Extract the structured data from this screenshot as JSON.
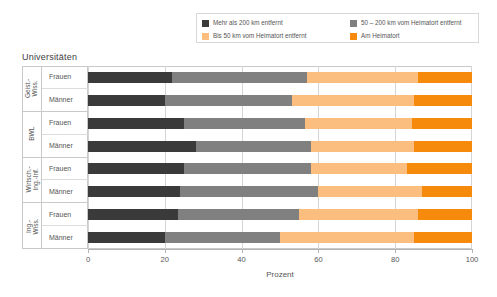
{
  "chart_data": {
    "type": "bar",
    "orientation": "horizontal",
    "stacked": true,
    "stacked_mode": "percent",
    "title": "Universitäten",
    "xlabel": "Prozent",
    "ylabel": "",
    "xlim": [
      0,
      100
    ],
    "xticks": [
      "0",
      "20",
      "40",
      "60",
      "80",
      "100"
    ],
    "grid": true,
    "legend_position": "top",
    "legend": [
      {
        "label": "Mehr als 200 km entfernt",
        "color": "#3a3a3a"
      },
      {
        "label": "50 – 200 km vom Heimatort entfernt",
        "color": "#808080"
      },
      {
        "label": "Bis 50 km vom Heimatort entfernt",
        "color": "#fbbe7e"
      },
      {
        "label": "Am Heimatort",
        "color": "#f68a0c"
      }
    ],
    "groups": [
      {
        "label": "Geist.-\nWiss.",
        "rows": [
          {
            "label": "Frauen",
            "values": [
              22,
              35,
              29,
              14
            ]
          },
          {
            "label": "Männer",
            "values": [
              20,
              33,
              32,
              15
            ]
          }
        ]
      },
      {
        "label": "BWL",
        "rows": [
          {
            "label": "Frauen",
            "values": [
              25,
              31.5,
              28,
              15.5
            ]
          },
          {
            "label": "Männer",
            "values": [
              28,
              30,
              27,
              15
            ]
          }
        ]
      },
      {
        "label": "Wirtsch.-\nIng.-Inf.",
        "rows": [
          {
            "label": "Frauen",
            "values": [
              25,
              33,
              25,
              17
            ]
          },
          {
            "label": "Männer",
            "values": [
              24,
              36,
              27,
              13
            ]
          }
        ]
      },
      {
        "label": "Ing.-\nWiss.",
        "rows": [
          {
            "label": "Frauen",
            "values": [
              23.5,
              31.5,
              31,
              14
            ]
          },
          {
            "label": "Männer",
            "values": [
              20,
              30,
              35,
              15
            ]
          }
        ]
      }
    ],
    "categories": [
      "Geist.-Wiss. Frauen",
      "Geist.-Wiss. Männer",
      "BWL Frauen",
      "BWL Männer",
      "Wirtsch.-Ing.-Inf. Frauen",
      "Wirtsch.-Ing.-Inf. Männer",
      "Ing.-Wiss. Frauen",
      "Ing.-Wiss. Männer"
    ],
    "series": [
      {
        "name": "Mehr als 200 km entfernt",
        "values": [
          22,
          20,
          25,
          28,
          25,
          24,
          23.5,
          20
        ]
      },
      {
        "name": "50 – 200 km vom Heimatort entfernt",
        "values": [
          35,
          33,
          31.5,
          30,
          33,
          36,
          31.5,
          30
        ]
      },
      {
        "name": "Bis 50 km vom Heimatort entfernt",
        "values": [
          29,
          32,
          28,
          27,
          25,
          27,
          31,
          35
        ]
      },
      {
        "name": "Am Heimatort",
        "values": [
          14,
          15,
          15.5,
          15,
          17,
          13,
          14,
          15
        ]
      }
    ]
  }
}
